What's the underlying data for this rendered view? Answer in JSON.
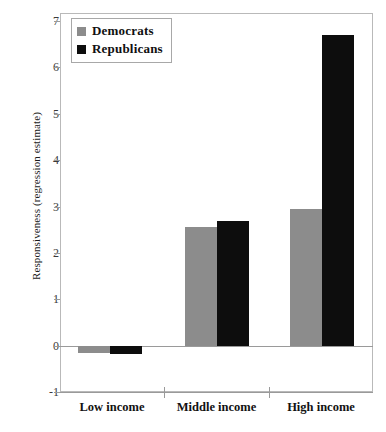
{
  "chart_data": {
    "type": "bar",
    "title": "",
    "xlabel": "",
    "ylabel": "Responsiveness (regression estimate)",
    "categories": [
      "Low income",
      "Middle income",
      "High income"
    ],
    "series": [
      {
        "name": "Democrats",
        "color": "#8c8c8c",
        "values": [
          -0.16,
          2.56,
          2.95
        ]
      },
      {
        "name": "Republicans",
        "color": "#0d0d0d",
        "values": [
          -0.17,
          2.68,
          6.7
        ]
      }
    ],
    "ylim": [
      -1,
      7
    ],
    "yticks": [
      7,
      6,
      5,
      4,
      3,
      2,
      1,
      0,
      -1
    ],
    "ytick_labels": [
      "7",
      "6",
      "5",
      "4",
      "3",
      "2",
      "1",
      "0",
      "-1"
    ],
    "grid": false,
    "legend_position": "top-left",
    "zero_line": true
  },
  "legend": {
    "entries": [
      {
        "label": "Democrats",
        "swatch": "dem"
      },
      {
        "label": "Republicans",
        "swatch": "rep"
      }
    ]
  },
  "axis": {
    "y_title": "Responsiveness (regression estimate)"
  }
}
